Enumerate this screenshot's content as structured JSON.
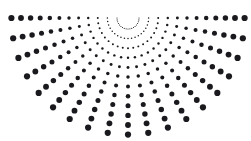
{
  "canvas": {
    "width": 251,
    "height": 141,
    "background_color": "#ffffff"
  },
  "figure": {
    "name": "radial-dot-burst",
    "dot_color": "#1a1a1e",
    "center_x": 128,
    "center_y": 18,
    "arm_count": 19,
    "angle_start_deg": 0,
    "angle_end_deg": 180,
    "rings": 12,
    "radius_first": 11,
    "radius_step": 9.6,
    "dot_radius_min": 0.55,
    "dot_radius_max": 3.1,
    "dot_radius_gamma": 1.55
  },
  "chart_data": {
    "type": "scatter",
    "title": "",
    "subtitle": "",
    "xlabel": "",
    "ylabel": "",
    "xlim": [
      0,
      251
    ],
    "ylim": [
      141,
      0
    ],
    "grid": false,
    "legend": null,
    "annotations": [],
    "coordinate_system": "polar-fan",
    "polar": {
      "center": [
        128,
        18
      ],
      "theta_degrees": [
        0,
        10,
        20,
        30,
        40,
        50,
        60,
        70,
        80,
        90,
        100,
        110,
        120,
        130,
        140,
        150,
        160,
        170,
        180
      ],
      "radii": [
        11,
        20.6,
        30.2,
        39.8,
        49.4,
        59,
        68.6,
        78.2,
        87.8,
        97.4,
        107,
        116.6
      ],
      "dot_radius_by_ring": [
        0.55,
        0.75,
        0.98,
        1.22,
        1.48,
        1.74,
        2.0,
        2.26,
        2.5,
        2.72,
        2.92,
        3.1
      ]
    },
    "series": [
      {
        "name": "ring-1",
        "radius": 11,
        "dot_radius": 0.55,
        "point_count": 19
      },
      {
        "name": "ring-2",
        "radius": 20.6,
        "dot_radius": 0.75,
        "point_count": 19
      },
      {
        "name": "ring-3",
        "radius": 30.2,
        "dot_radius": 0.98,
        "point_count": 19
      },
      {
        "name": "ring-4",
        "radius": 39.8,
        "dot_radius": 1.22,
        "point_count": 19
      },
      {
        "name": "ring-5",
        "radius": 49.4,
        "dot_radius": 1.48,
        "point_count": 19
      },
      {
        "name": "ring-6",
        "radius": 59,
        "dot_radius": 1.74,
        "point_count": 19
      },
      {
        "name": "ring-7",
        "radius": 68.6,
        "dot_radius": 2.0,
        "point_count": 19
      },
      {
        "name": "ring-8",
        "radius": 78.2,
        "dot_radius": 2.26,
        "point_count": 19
      },
      {
        "name": "ring-9",
        "radius": 87.8,
        "dot_radius": 2.5,
        "point_count": 19
      },
      {
        "name": "ring-10",
        "radius": 97.4,
        "dot_radius": 2.72,
        "point_count": 19
      },
      {
        "name": "ring-11",
        "radius": 107,
        "dot_radius": 2.92,
        "point_count": 19
      },
      {
        "name": "ring-12",
        "radius": 116.6,
        "dot_radius": 3.1,
        "point_count": 19
      }
    ]
  }
}
